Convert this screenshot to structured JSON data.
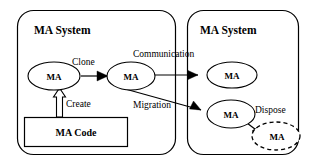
{
  "diagram": {
    "type": "block-diagram",
    "canvas": {
      "width": 313,
      "height": 165
    },
    "colors": {
      "background": "#ffffff",
      "stroke": "#000000",
      "fill": "#ffffff"
    },
    "panels": [
      {
        "id": "left-panel",
        "label": "MA System",
        "x": 17,
        "y": 10,
        "width": 159,
        "height": 145,
        "corner_radius": 16
      },
      {
        "id": "right-panel",
        "label": "MA System",
        "x": 187,
        "y": 10,
        "width": 112,
        "height": 145,
        "corner_radius": 16
      }
    ],
    "nodes": [
      {
        "id": "ma-origin",
        "label": "MA",
        "shape": "ellipse",
        "style": "solid",
        "cx": 54,
        "cy": 76,
        "rx": 26,
        "ry": 14
      },
      {
        "id": "ma-clone",
        "label": "MA",
        "shape": "ellipse",
        "style": "solid",
        "cx": 131,
        "cy": 76,
        "rx": 24,
        "ry": 14
      },
      {
        "id": "ma-remote-top",
        "label": "MA",
        "shape": "ellipse",
        "style": "solid",
        "cx": 232,
        "cy": 75,
        "rx": 25,
        "ry": 13
      },
      {
        "id": "ma-remote-bottom",
        "label": "MA",
        "shape": "ellipse",
        "style": "solid",
        "cx": 231,
        "cy": 114,
        "rx": 24,
        "ry": 14
      },
      {
        "id": "ma-disposed",
        "label": "MA",
        "shape": "ellipse",
        "style": "dashed",
        "cx": 276,
        "cy": 136,
        "rx": 24,
        "ry": 14
      },
      {
        "id": "ma-code",
        "label": "MA Code",
        "shape": "rectangle",
        "style": "solid",
        "x": 24,
        "y": 117,
        "width": 104,
        "height": 30
      }
    ],
    "edges": [
      {
        "id": "edge-clone",
        "label": "Clone",
        "from": "ma-origin",
        "to": "ma-clone",
        "style": "solid-arrow",
        "label_x": 72,
        "label_y": 64
      },
      {
        "id": "edge-create",
        "label": "Create",
        "from": "ma-code",
        "to": "ma-origin",
        "style": "hollow-block-arrow",
        "label_x": 66,
        "label_y": 104
      },
      {
        "id": "edge-communication",
        "label": "Communication",
        "from": "ma-clone",
        "to": "ma-remote-top",
        "style": "solid-arrow",
        "label_x": 133,
        "label_y": 56
      },
      {
        "id": "edge-migration",
        "label": "Migration",
        "from": "ma-clone",
        "to": "ma-remote-bottom",
        "style": "solid-arrow",
        "label_x": 134,
        "label_y": 105
      },
      {
        "id": "edge-dispose",
        "label": "Dispose",
        "from": "ma-remote-bottom",
        "to": "ma-disposed",
        "style": "solid-arrow-curved",
        "label_x": 257,
        "label_y": 110
      }
    ],
    "labels": {
      "system_left": "MA System",
      "system_right": "MA System",
      "node_ma": "MA",
      "node_ma_code": "MA Code",
      "edge_clone": "Clone",
      "edge_create": "Create",
      "edge_communication": "Communication",
      "edge_migration": "Migration",
      "edge_dispose": "Dispose"
    }
  }
}
